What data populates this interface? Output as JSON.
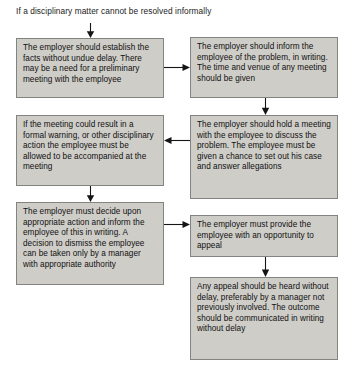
{
  "diagram": {
    "heading": "If a disciplinary matter cannot be resolved informally",
    "colors": {
      "node_fill": "#cfcdc8",
      "node_border": "#83837f",
      "text": "#101010",
      "arrow": "#151515",
      "background": "#ffffff"
    },
    "nodes": [
      {
        "id": "establish-facts",
        "text": "The employer should establish the facts without undue delay. There may be a need for a preliminary meeting with the employee"
      },
      {
        "id": "inform-employee",
        "text": "The employer should inform the employee of the problem, in writing. The time and venue of any meeting should be given"
      },
      {
        "id": "accompanied-at-meeting",
        "text": "If the meeting could result in a formal warning, or other disciplinary action the employee must be allowed to be accompanied at the meeting"
      },
      {
        "id": "hold-meeting",
        "text": "The employer should hold a meeting with the employee to discuss the problem. The employee must be given a chance to set out his case and answer allegations"
      },
      {
        "id": "decide-action",
        "text": "The employer must decide upon appropriate action and inform the employee of this in writing.  A decision to dismiss the employee can be taken only by a manager with appropriate authority"
      },
      {
        "id": "opportunity-to-appeal",
        "text": "The employer must provide the employee with an opportunity to appeal"
      },
      {
        "id": "appeal-heard",
        "text": "Any appeal should be heard without delay, preferably by a manager not previously involved. The outcome should be communicated in writing without delay"
      }
    ],
    "connectors": [
      {
        "id": "heading-to-establish-facts",
        "direction": "down"
      },
      {
        "id": "establish-facts-to-inform-employee",
        "direction": "right"
      },
      {
        "id": "inform-employee-to-hold-meeting",
        "direction": "down"
      },
      {
        "id": "hold-meeting-to-accompanied-at-meeting",
        "direction": "left"
      },
      {
        "id": "accompanied-at-meeting-to-decide-action",
        "direction": "down"
      },
      {
        "id": "decide-action-to-opportunity-to-appeal",
        "direction": "right"
      },
      {
        "id": "opportunity-to-appeal-to-appeal-heard",
        "direction": "down"
      }
    ]
  }
}
